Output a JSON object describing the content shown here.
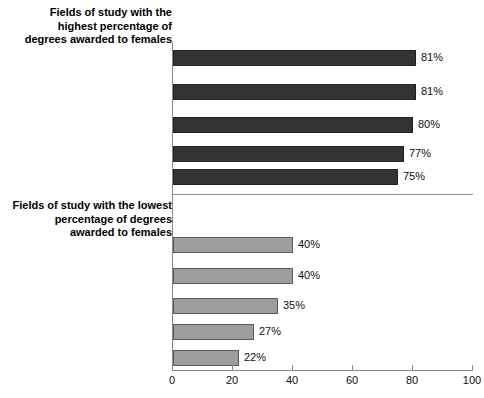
{
  "chart_data": {
    "type": "bar",
    "orientation": "horizontal",
    "title": "",
    "xlabel": "",
    "ylabel": "",
    "xlim": [
      0,
      100
    ],
    "xticks": [
      0,
      20,
      40,
      60,
      80,
      100
    ],
    "grid": false,
    "legend": null,
    "groups": [
      {
        "heading": "Fields of study with the\nhighest percentage of\ndegrees awarded to females",
        "bar_color": "#333333",
        "categories": [
          "Library science",
          "Health professions and\nrelated clinical sciences",
          "Psychology",
          "Education",
          "Public administration in\nsocial service professions"
        ],
        "values": [
          81,
          81,
          80,
          77,
          75
        ],
        "value_labels": [
          "81%",
          "81%",
          "80%",
          "77%",
          "75%"
        ]
      },
      {
        "heading": "Fields of study with the lowest\npercentage of degrees\nawarded to females",
        "bar_color": "#9d9d9d",
        "categories": [
          "Mathematics and statistics",
          "Physical sciences and\nscience technologies",
          "Theology and\nreligious vocations",
          "Computer and information\nsciences and support services",
          "Engineering and\nengineering technologies"
        ],
        "values": [
          40,
          40,
          35,
          27,
          22
        ],
        "value_labels": [
          "40%",
          "40%",
          "35%",
          "27%",
          "22%"
        ]
      }
    ]
  },
  "axis": {
    "tick_labels": [
      "0",
      "20",
      "40",
      "60",
      "80",
      "100"
    ]
  },
  "high_group": {
    "heading": "Fields of study with the\nhighest percentage of\ndegrees awarded to females",
    "rows": [
      {
        "label": "Library science",
        "value": "81%"
      },
      {
        "label": "Health professions and\nrelated clinical sciences",
        "value": "81%"
      },
      {
        "label": "Psychology",
        "value": "80%"
      },
      {
        "label": "Education",
        "value": "77%"
      },
      {
        "label": "Public administration in\nsocial service professions",
        "value": "75%"
      }
    ]
  },
  "low_group": {
    "heading": "Fields of study with the lowest\npercentage of degrees\nawarded to females",
    "rows": [
      {
        "label": "Mathematics and statistics",
        "value": "40%"
      },
      {
        "label": "Physical sciences and\nscience technologies",
        "value": "40%"
      },
      {
        "label": "Theology and\nreligious vocations",
        "value": "35%"
      },
      {
        "label": "Computer and information\nsciences and support services",
        "value": "27%"
      },
      {
        "label": "Engineering and\nengineering technologies",
        "value": "22%"
      }
    ]
  }
}
